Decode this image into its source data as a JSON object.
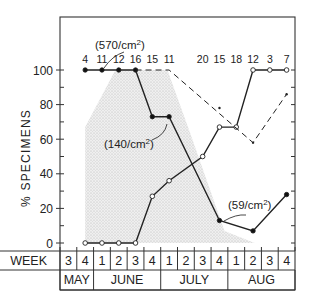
{
  "chart_data": {
    "type": "line",
    "title": "",
    "xlabel": "WEEK",
    "ylabel": "% SPECIMENS",
    "ylim": [
      0,
      100
    ],
    "yticks": [
      0,
      20,
      40,
      60,
      80,
      100
    ],
    "ytick_labels": [
      "0",
      "20",
      "40",
      "60",
      "80",
      "100"
    ],
    "grid": false,
    "legend": null,
    "x_weeks": [
      "3",
      "4",
      "1",
      "2",
      "3",
      "4",
      "1",
      "2",
      "3",
      "4",
      "1",
      "2",
      "3",
      "4"
    ],
    "x_months": [
      {
        "label": "MAY",
        "span": 2
      },
      {
        "label": "JUNE",
        "span": 4
      },
      {
        "label": "JULY",
        "span": 4
      },
      {
        "label": "AUG",
        "span": 4
      }
    ],
    "sample_counts": [
      {
        "x_index": 1,
        "label": "4"
      },
      {
        "x_index": 2,
        "label": "11"
      },
      {
        "x_index": 3,
        "label": "12"
      },
      {
        "x_index": 4,
        "label": "16"
      },
      {
        "x_index": 5,
        "label": "15"
      },
      {
        "x_index": 6,
        "label": "11"
      },
      {
        "x_index": 8,
        "label": "20"
      },
      {
        "x_index": 9,
        "label": "15"
      },
      {
        "x_index": 10,
        "label": "18"
      },
      {
        "x_index": 11,
        "label": "12"
      },
      {
        "x_index": 12,
        "label": "3"
      },
      {
        "x_index": 13,
        "label": "7"
      }
    ],
    "series": [
      {
        "name": "filled-circles-solid",
        "style": "solid, filled markers",
        "points": [
          [
            1,
            100
          ],
          [
            2,
            100
          ],
          [
            3,
            100
          ],
          [
            4,
            100
          ],
          [
            5,
            73
          ],
          [
            6,
            73
          ],
          [
            9,
            13
          ],
          [
            11,
            7
          ],
          [
            13,
            28
          ]
        ]
      },
      {
        "name": "open-circles-solid",
        "style": "solid, open markers",
        "points": [
          [
            1,
            0
          ],
          [
            2,
            0
          ],
          [
            3,
            0
          ],
          [
            4,
            0
          ],
          [
            5,
            27
          ],
          [
            6,
            36
          ],
          [
            8,
            50
          ],
          [
            9,
            67
          ],
          [
            10,
            67
          ],
          [
            11,
            100
          ],
          [
            12,
            100
          ],
          [
            13,
            100
          ]
        ]
      },
      {
        "name": "dashed",
        "style": "dashed",
        "points": [
          [
            4,
            100
          ],
          [
            6,
            100
          ],
          [
            11,
            58
          ],
          [
            13,
            86
          ]
        ]
      }
    ],
    "shaded_region": {
      "description": "stippled area indicating density period",
      "points": [
        [
          1,
          0
        ],
        [
          1,
          67
        ],
        [
          2.8,
          100
        ],
        [
          5.9,
          100
        ],
        [
          7.2,
          65
        ],
        [
          9.3,
          7
        ],
        [
          11.1,
          0
        ]
      ]
    },
    "annotations": [
      {
        "text": "(570/cm²)",
        "x_index": 2,
        "y": 100
      },
      {
        "text": "(140/cm²)",
        "x_index": 6,
        "y": 73
      },
      {
        "text": "(59/cm²)",
        "x_index": 9,
        "y": 13
      }
    ]
  },
  "labels": {
    "ylabel": "% SPECIMENS",
    "week_header": "WEEK",
    "anno_570": "(570/cm²)",
    "anno_140": "(140/cm²)",
    "anno_59": "(59/cm²)"
  }
}
